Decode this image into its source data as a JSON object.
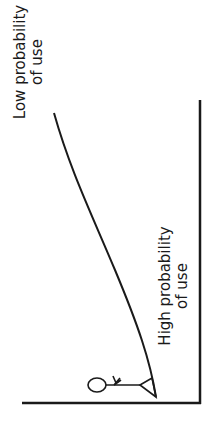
{
  "diagram": {
    "labels": {
      "low": {
        "line1": "Low probability",
        "line2": "of use"
      },
      "high": {
        "line1": "High probability",
        "line2": "of use"
      }
    },
    "figure": "stick-figure-person",
    "colors": {
      "stroke": "#1a1a1a",
      "background": "#ffffff"
    }
  }
}
